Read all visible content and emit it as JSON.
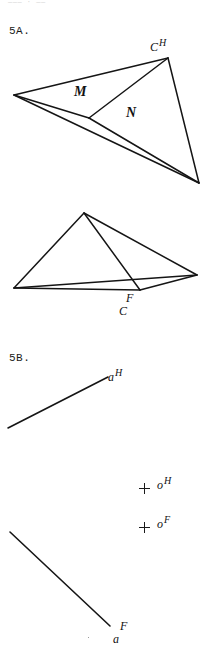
{
  "page": {
    "header_ghost": "——— · ——",
    "width": 206,
    "height": 654,
    "background": "#ffffff",
    "ink_color": "#151515"
  },
  "problems": [
    {
      "id": "5A",
      "label": "5A."
    },
    {
      "id": "5B",
      "label": "5B."
    }
  ],
  "figure_5a": {
    "top_view": {
      "type": "triangle-with-interior-point",
      "vertices": {
        "left": [
          14,
          95
        ],
        "apex": [
          168,
          58
        ],
        "bottom_right": [
          199,
          183
        ],
        "interior": [
          89,
          118
        ]
      },
      "edges": [
        [
          [
            14,
            95
          ],
          [
            168,
            58
          ]
        ],
        [
          [
            168,
            58
          ],
          [
            199,
            183
          ]
        ],
        [
          [
            199,
            183
          ],
          [
            14,
            95
          ]
        ],
        [
          [
            14,
            95
          ],
          [
            89,
            118
          ]
        ],
        [
          [
            89,
            118
          ],
          [
            168,
            58
          ]
        ],
        [
          [
            89,
            118
          ],
          [
            199,
            183
          ]
        ]
      ],
      "labels": {
        "apex": {
          "base": "C",
          "sup": "H",
          "x": 150,
          "y": 38
        },
        "region_left": {
          "text": "M",
          "x": 74,
          "y": 84
        },
        "region_right": {
          "text": "N",
          "x": 126,
          "y": 105
        }
      }
    },
    "bottom_view": {
      "type": "triangle-with-interior-point",
      "vertices": {
        "left": [
          14,
          288
        ],
        "apex": [
          84,
          213
        ],
        "right": [
          197,
          275
        ],
        "interior": [
          140,
          290
        ]
      },
      "edges": [
        [
          [
            14,
            288
          ],
          [
            84,
            213
          ]
        ],
        [
          [
            84,
            213
          ],
          [
            197,
            275
          ]
        ],
        [
          [
            197,
            275
          ],
          [
            14,
            288
          ]
        ],
        [
          [
            14,
            288
          ],
          [
            140,
            290
          ]
        ],
        [
          [
            84,
            213
          ],
          [
            140,
            290
          ]
        ],
        [
          [
            140,
            290
          ],
          [
            197,
            275
          ]
        ]
      ],
      "labels": {
        "interior": {
          "top": "F",
          "bottom": "C",
          "x": 119,
          "y": 292
        }
      }
    }
  },
  "figure_5b": {
    "line_top": {
      "name": "line-a-H",
      "from": [
        8,
        428
      ],
      "to": [
        108,
        377
      ],
      "label": {
        "base": "a",
        "sup": "H",
        "x": 108,
        "y": 368
      }
    },
    "line_bottom": {
      "name": "line-a-F",
      "from": [
        10,
        532
      ],
      "to": [
        110,
        626
      ],
      "label": {
        "top": "F",
        "bottom": "a",
        "x": 113,
        "y": 620
      }
    },
    "points": [
      {
        "name": "point-o-H",
        "cross": [
          139,
          483
        ],
        "label": {
          "base": "o",
          "sup": "H",
          "x": 157,
          "y": 476
        }
      },
      {
        "name": "point-o-F",
        "cross": [
          139,
          522
        ],
        "label": {
          "base": "o",
          "sup": "F",
          "x": 157,
          "y": 515
        }
      }
    ],
    "speck": [
      88,
      637
    ]
  }
}
